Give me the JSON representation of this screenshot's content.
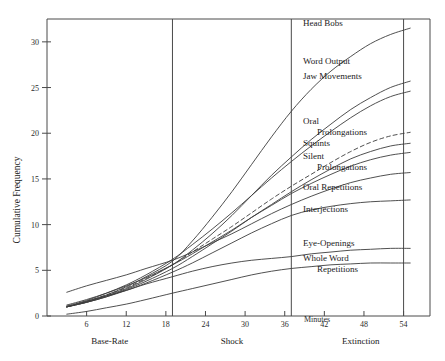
{
  "chart_data": {
    "type": "line",
    "title": "",
    "xlabel": "Minutes",
    "ylabel": "Cumulative Frequency",
    "xlim": [
      0,
      58
    ],
    "ylim": [
      0,
      32.5
    ],
    "grid": false,
    "legend_position": "right-inline-labels",
    "x_ticks": [
      6,
      12,
      18,
      24,
      30,
      36,
      42,
      48,
      54
    ],
    "y_ticks": [
      0,
      5,
      10,
      15,
      20,
      25,
      30
    ],
    "x_unit_suffix": "Minutes",
    "phases": [
      {
        "name": "Base-Rate",
        "start": 0,
        "end": 19
      },
      {
        "name": "Shock",
        "start": 19,
        "end": 37
      },
      {
        "name": "Extinction",
        "start": 37,
        "end": 58
      }
    ],
    "phase_dividers": [
      19,
      37,
      54
    ],
    "series": [
      {
        "name": "Head Bobs",
        "style": "solid",
        "x": [
          3,
          6,
          9,
          12,
          15,
          19,
          22,
          25,
          28,
          31,
          34,
          37,
          40,
          43,
          46,
          49,
          52,
          55
        ],
        "values": [
          1.0,
          1.6,
          2.3,
          3.2,
          4.3,
          6.0,
          8.2,
          10.8,
          13.6,
          16.6,
          19.6,
          22.4,
          24.8,
          26.8,
          28.4,
          29.8,
          30.8,
          31.5
        ]
      },
      {
        "name": "Word Output",
        "style": "solid",
        "x": [
          3,
          6,
          9,
          12,
          15,
          19,
          22,
          25,
          28,
          31,
          34,
          37,
          40,
          43,
          46,
          49,
          52,
          55
        ],
        "values": [
          1.0,
          1.5,
          2.2,
          3.0,
          4.0,
          5.6,
          7.2,
          9.0,
          11.0,
          13.2,
          15.4,
          17.4,
          19.3,
          21.0,
          22.6,
          23.9,
          25.0,
          25.7
        ]
      },
      {
        "name": "Jaw Movements",
        "style": "solid",
        "x": [
          3,
          6,
          9,
          12,
          15,
          19,
          22,
          25,
          28,
          31,
          34,
          37,
          40,
          43,
          46,
          49,
          52,
          55
        ],
        "values": [
          1.1,
          1.7,
          2.5,
          3.4,
          4.5,
          6.2,
          7.8,
          9.5,
          11.3,
          13.2,
          15.1,
          16.9,
          18.6,
          20.2,
          21.7,
          23.0,
          24.0,
          24.6
        ]
      },
      {
        "name": "Oral Prolongations",
        "style": "dashed",
        "x": [
          3,
          6,
          9,
          12,
          15,
          19,
          22,
          25,
          28,
          31,
          34,
          37,
          40,
          43,
          46,
          49,
          52,
          55
        ],
        "values": [
          1.0,
          1.6,
          2.3,
          3.1,
          4.1,
          5.6,
          7.0,
          8.4,
          9.8,
          11.3,
          12.8,
          14.2,
          15.5,
          16.8,
          18.0,
          19.0,
          19.7,
          20.1
        ]
      },
      {
        "name": "Squints",
        "style": "solid",
        "x": [
          3,
          6,
          9,
          12,
          15,
          19,
          22,
          25,
          28,
          31,
          34,
          37,
          40,
          43,
          46,
          49,
          52,
          55
        ],
        "values": [
          1.0,
          1.5,
          2.1,
          2.9,
          3.8,
          5.2,
          6.5,
          7.9,
          9.3,
          10.8,
          12.2,
          13.6,
          14.9,
          16.1,
          17.2,
          18.0,
          18.6,
          18.9
        ]
      },
      {
        "name": "Silent Prolongations",
        "style": "solid",
        "x": [
          3,
          6,
          9,
          12,
          15,
          19,
          22,
          25,
          28,
          31,
          34,
          37,
          40,
          43,
          46,
          49,
          52,
          55
        ],
        "values": [
          1.2,
          1.8,
          2.5,
          3.3,
          4.2,
          5.6,
          6.8,
          8.1,
          9.4,
          10.8,
          12.1,
          13.4,
          14.5,
          15.5,
          16.4,
          17.1,
          17.6,
          17.9
        ]
      },
      {
        "name": "Oral Repetitions",
        "style": "solid",
        "x": [
          3,
          6,
          9,
          12,
          15,
          19,
          22,
          25,
          28,
          31,
          34,
          37,
          40,
          43,
          46,
          49,
          52,
          55
        ],
        "values": [
          2.6,
          3.3,
          3.9,
          4.5,
          5.2,
          6.1,
          7.0,
          8.0,
          9.0,
          10.1,
          11.2,
          12.2,
          13.1,
          13.9,
          14.6,
          15.1,
          15.5,
          15.7
        ]
      },
      {
        "name": "Interjections",
        "style": "solid",
        "x": [
          3,
          6,
          9,
          12,
          15,
          19,
          22,
          25,
          28,
          31,
          34,
          37,
          40,
          43,
          46,
          49,
          52,
          55
        ],
        "values": [
          1.0,
          1.5,
          2.1,
          2.8,
          3.6,
          4.8,
          5.8,
          6.9,
          8.0,
          9.1,
          10.1,
          11.0,
          11.6,
          12.0,
          12.3,
          12.5,
          12.6,
          12.7
        ]
      },
      {
        "name": "Eye-Openings",
        "style": "solid",
        "x": [
          3,
          6,
          9,
          12,
          15,
          19,
          22,
          25,
          28,
          31,
          34,
          37,
          40,
          43,
          46,
          49,
          52,
          55
        ],
        "values": [
          1.0,
          1.6,
          2.2,
          2.8,
          3.5,
          4.3,
          4.9,
          5.4,
          5.8,
          6.1,
          6.3,
          6.5,
          6.8,
          7.0,
          7.2,
          7.3,
          7.4,
          7.4
        ]
      },
      {
        "name": "Whole Word Repetitions",
        "style": "solid",
        "x": [
          3,
          6,
          9,
          12,
          15,
          19,
          22,
          25,
          28,
          31,
          34,
          37,
          40,
          43,
          46,
          49,
          52,
          55
        ],
        "values": [
          0.2,
          0.5,
          0.9,
          1.3,
          1.8,
          2.5,
          3.0,
          3.5,
          4.0,
          4.5,
          4.9,
          5.2,
          5.4,
          5.6,
          5.7,
          5.8,
          5.8,
          5.8
        ]
      }
    ],
    "annotations": [
      {
        "id": "head-bobs",
        "label": "Head Bobs",
        "lines": [
          "Head Bobs"
        ]
      },
      {
        "id": "word-output",
        "label": "Word Output",
        "lines": [
          "Word Output"
        ]
      },
      {
        "id": "jaw-movements",
        "label": "Jaw Movements",
        "lines": [
          "Jaw Movements"
        ]
      },
      {
        "id": "oral-prolongations",
        "label": "Oral Prolongations",
        "lines": [
          "Oral",
          "Prolongations"
        ]
      },
      {
        "id": "squints",
        "label": "Squints",
        "lines": [
          "Squints"
        ]
      },
      {
        "id": "silent-prolongations",
        "label": "Silent Prolongations",
        "lines": [
          "Silent",
          "Prolongations"
        ]
      },
      {
        "id": "oral-repetitions",
        "label": "Oral Repetitions",
        "lines": [
          "Oral Repetitions"
        ]
      },
      {
        "id": "interjections",
        "label": "Interjections",
        "lines": [
          "Interjections"
        ]
      },
      {
        "id": "eye-openings",
        "label": "Eye-Openings",
        "lines": [
          "Eye-Openings"
        ]
      },
      {
        "id": "whole-word-repetitions",
        "label": "Whole Word Repetitions",
        "lines": [
          "Whole Word",
          "Repetitions"
        ]
      }
    ],
    "colors": {
      "line": "#3c3c3c",
      "axis": "#4a4a4a",
      "text": "#1a1a1a",
      "background": "#ffffff"
    }
  }
}
